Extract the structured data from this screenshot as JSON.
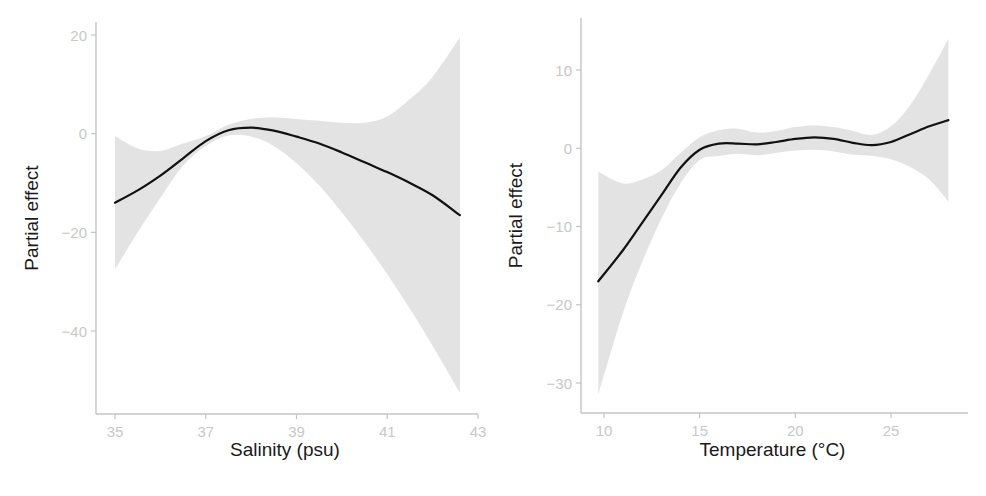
{
  "chart_data": [
    {
      "type": "line",
      "title": "",
      "xlabel": "Salinity (psu)",
      "ylabel": "Partial effect",
      "xlim": [
        34.8,
        43.0
      ],
      "ylim": [
        -57,
        23
      ],
      "xticks": [
        35,
        37,
        39,
        41,
        43
      ],
      "xtick_labels": [
        "35",
        "37",
        "39",
        "41",
        "43"
      ],
      "yticks": [
        20,
        0,
        -20,
        -40
      ],
      "ytick_labels": [
        "20",
        "0",
        "−20",
        "−40"
      ],
      "grid": false,
      "legend": null,
      "series": [
        {
          "name": "fit",
          "x": [
            35.0,
            35.5,
            36.0,
            36.5,
            37.0,
            37.5,
            38.0,
            38.5,
            39.0,
            39.5,
            40.0,
            40.5,
            41.0,
            41.5,
            42.0,
            42.6
          ],
          "y": [
            -14.0,
            -11.5,
            -8.5,
            -5.0,
            -1.5,
            0.7,
            1.2,
            0.6,
            -0.6,
            -2.0,
            -3.8,
            -5.8,
            -7.8,
            -10.0,
            -12.5,
            -16.5
          ],
          "lower": [
            -27.5,
            -20.0,
            -13.0,
            -6.5,
            -2.5,
            -0.4,
            -0.6,
            -2.5,
            -6.0,
            -10.5,
            -16.0,
            -22.0,
            -28.5,
            -35.5,
            -43.0,
            -52.5
          ],
          "upper": [
            -0.5,
            -3.0,
            -3.5,
            -2.0,
            -0.5,
            1.8,
            3.0,
            3.3,
            3.0,
            2.6,
            2.2,
            2.2,
            3.5,
            7.0,
            11.5,
            19.5
          ]
        }
      ]
    },
    {
      "type": "line",
      "title": "",
      "xlabel": "Temperature (°C)",
      "ylabel": "Partial effect",
      "xlim": [
        8.8,
        29.2
      ],
      "ylim": [
        -34,
        17
      ],
      "xticks": [
        10,
        15,
        20,
        25
      ],
      "xtick_labels": [
        "10",
        "15",
        "20",
        "25"
      ],
      "yticks": [
        10,
        0,
        -10,
        -20,
        -30
      ],
      "ytick_labels": [
        "10",
        "0",
        "−10",
        "−20",
        "−30"
      ],
      "grid": false,
      "legend": null,
      "series": [
        {
          "name": "fit",
          "x": [
            9.7,
            11.0,
            12.0,
            13.0,
            14.0,
            15.0,
            16.0,
            17.0,
            18.0,
            19.0,
            20.0,
            21.0,
            22.0,
            23.0,
            24.0,
            25.0,
            26.0,
            27.0,
            28.0
          ],
          "y": [
            -17.0,
            -13.0,
            -9.5,
            -6.0,
            -2.5,
            -0.2,
            0.6,
            0.6,
            0.5,
            0.8,
            1.2,
            1.4,
            1.2,
            0.7,
            0.4,
            0.8,
            1.8,
            2.8,
            3.6
          ],
          "lower": [
            -31.5,
            -21.0,
            -14.5,
            -9.0,
            -4.5,
            -1.5,
            -1.0,
            -0.7,
            -0.9,
            -0.6,
            -0.3,
            -0.2,
            -0.4,
            -0.8,
            -1.0,
            -1.4,
            -2.4,
            -4.0,
            -6.8
          ],
          "upper": [
            -3.0,
            -4.5,
            -4.0,
            -2.8,
            -0.6,
            1.4,
            2.3,
            2.5,
            2.0,
            2.2,
            2.7,
            2.9,
            2.7,
            2.2,
            1.7,
            2.8,
            5.5,
            9.5,
            14.0
          ]
        }
      ]
    }
  ]
}
